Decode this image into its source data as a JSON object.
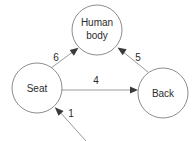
{
  "diagram": {
    "type": "directed-graph",
    "background_color": "#ffffff",
    "node_stroke_color": "#8c8c8c",
    "edge_color": "#9a9a9a",
    "arrow_color": "#3a3a3a",
    "text_color": "#2b2b2b",
    "nodes": [
      {
        "id": "human-body",
        "label_line1": "Human",
        "label_line2": "body",
        "cx": 97,
        "cy": 30,
        "r": 25
      },
      {
        "id": "seat",
        "label_line1": "Seat",
        "label_line2": "",
        "cx": 37,
        "cy": 88,
        "r": 25
      },
      {
        "id": "back",
        "label_line1": "Back",
        "label_line2": "",
        "cx": 163,
        "cy": 93,
        "r": 25
      }
    ],
    "edges": [
      {
        "id": "seat-to-human-body",
        "label": "6",
        "from": "seat",
        "to": "human-body",
        "label_x": 56,
        "label_y": 58
      },
      {
        "id": "back-to-human-body",
        "label": "5",
        "from": "back",
        "to": "human-body",
        "label_x": 138,
        "label_y": 58
      },
      {
        "id": "seat-to-back",
        "label": "4",
        "from": "seat",
        "to": "back",
        "label_x": 96,
        "label_y": 81
      },
      {
        "id": "external-to-seat",
        "label": "1",
        "from": "external",
        "to": "seat",
        "label_x": 71,
        "label_y": 114
      }
    ]
  }
}
